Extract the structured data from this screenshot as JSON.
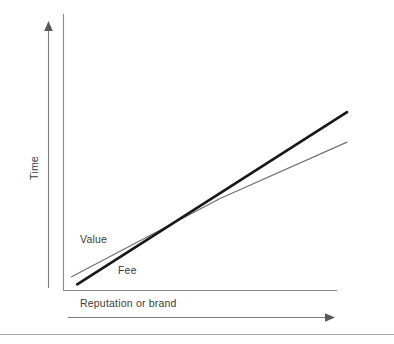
{
  "figure": {
    "background_color": "#ffffff",
    "width": 394,
    "height": 344
  },
  "chart_data": {
    "type": "line",
    "title": "",
    "subtitle": "",
    "xlabel": "Reputation or brand",
    "ylabel": "Time",
    "xlim": [
      0,
      100
    ],
    "ylim": [
      0,
      100
    ],
    "grid": false,
    "legend_position": "inline-annotations",
    "axis_ticks": {
      "x": [],
      "y": []
    },
    "series": [
      {
        "name": "Value",
        "style": "thin-gray-line",
        "color": "#6f6f6f",
        "stroke_width": 1.15,
        "x": [
          2,
          55,
          100
        ],
        "y": [
          6,
          48,
          78
        ],
        "label": "Value",
        "label_x": 6,
        "label_y": 22
      },
      {
        "name": "Fee",
        "style": "thick-black-line",
        "color": "#181818",
        "stroke_width": 2.6,
        "x": [
          4,
          100
        ],
        "y": [
          2,
          94
        ],
        "label": "Fee",
        "label_x": 20,
        "label_y": 9
      }
    ],
    "crossover": {
      "x": 67,
      "y": 53,
      "description": "Fee overtakes Value"
    }
  },
  "annotations": {
    "value_label": "Value",
    "fee_label": "Fee"
  },
  "axes": {
    "y_axis_title": "Time",
    "x_axis_title": "Reputation or brand",
    "y_direction_arrow": "up-arrow-icon",
    "x_direction_arrow": "right-arrow-icon"
  },
  "colors": {
    "fee_line": "#181818",
    "value_line": "#6f6f6f",
    "axis": "#8a8a8a",
    "arrow": "#5a5a5a",
    "text": "#3a3a3a",
    "footer_rule": "#a9a9a9",
    "background": "#ffffff"
  }
}
